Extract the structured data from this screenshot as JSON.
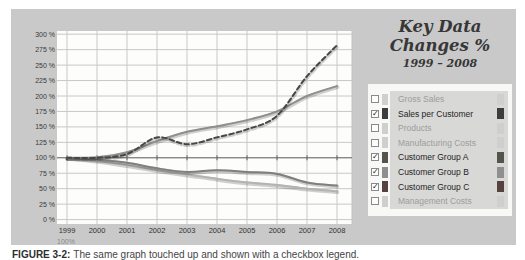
{
  "title": {
    "main": "Key Data Changes %",
    "subtitle": "1999 – 2008"
  },
  "caption": {
    "label": "FIGURE 3-2:",
    "text": "The same graph touched up and shown with a checkbox legend."
  },
  "axis": {
    "y_tick_labels": [
      "0 %",
      "25 %",
      "50 %",
      "75 %",
      "100 %",
      "125 %",
      "150 %",
      "175 %",
      "200 %",
      "225 %",
      "250 %",
      "275 %",
      "300 %"
    ],
    "baseline_label": "100%"
  },
  "legend": {
    "items": [
      {
        "label": "Gross Sales",
        "checked": false,
        "color": "#c6c6c4"
      },
      {
        "label": "Sales per Customer",
        "checked": true,
        "color": "#3d3d3d"
      },
      {
        "label": "Products",
        "checked": false,
        "color": "#c6c6c4"
      },
      {
        "label": "Manufacturing Costs",
        "checked": false,
        "color": "#c6c6c4"
      },
      {
        "label": "Customer Group A",
        "checked": true,
        "color": "#54544c"
      },
      {
        "label": "Customer Group B",
        "checked": true,
        "color": "#8f8f8f"
      },
      {
        "label": "Customer Group C",
        "checked": true,
        "color": "#564341"
      },
      {
        "label": "Management Costs",
        "checked": false,
        "color": "#c6c6c4"
      }
    ]
  },
  "chart_data": {
    "type": "line",
    "title": "Key Data Changes %",
    "subtitle": "1999 - 2008",
    "x": [
      1999,
      2000,
      2001,
      2002,
      2003,
      2004,
      2005,
      2006,
      2007,
      2008
    ],
    "ylim": [
      0,
      300
    ],
    "ytick_step": 25,
    "grid": true,
    "baseline_value": 100,
    "legend_position": "right",
    "series": [
      {
        "name": "Customer Group C",
        "style": "solid",
        "color": "#b3b3b0",
        "values": [
          100,
          95,
          88,
          80,
          73,
          66,
          60,
          56,
          50,
          46
        ]
      },
      {
        "name": "Customer Group B",
        "style": "solid",
        "color": "#7f7f7d",
        "values": [
          100,
          97,
          92,
          83,
          77,
          80,
          77,
          74,
          60,
          55
        ]
      },
      {
        "name": "Customer Group A",
        "style": "solid",
        "color": "#8f8f8d",
        "values": [
          100,
          101,
          109,
          127,
          142,
          151,
          161,
          175,
          200,
          216
        ]
      },
      {
        "name": "Sales per Customer",
        "style": "dashed",
        "color": "#474747",
        "values": [
          100,
          100,
          106,
          133,
          122,
          133,
          146,
          168,
          232,
          282
        ]
      }
    ]
  }
}
